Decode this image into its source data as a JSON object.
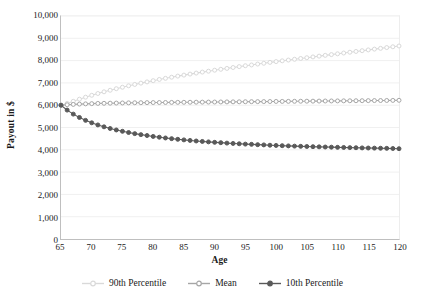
{
  "chart_data": {
    "type": "line",
    "title": "",
    "xlabel": "Age",
    "ylabel": "Payout in $",
    "xlim": [
      65,
      120
    ],
    "ylim": [
      0,
      10000
    ],
    "grid": true,
    "grid_axis": "y",
    "legend_position": "bottom",
    "xticklabels": [
      "65",
      "70",
      "75",
      "80",
      "85",
      "90",
      "95",
      "100",
      "105",
      "110",
      "115",
      "120"
    ],
    "xtickvalues": [
      65,
      70,
      75,
      80,
      85,
      90,
      95,
      100,
      105,
      110,
      115,
      120
    ],
    "yticklabels": [
      "0",
      "1,000",
      "2,000",
      "3,000",
      "4,000",
      "5,000",
      "6,000",
      "7,000",
      "8,000",
      "9,000",
      "10,000"
    ],
    "ytickvalues": [
      0,
      1000,
      2000,
      3000,
      4000,
      5000,
      6000,
      7000,
      8000,
      9000,
      10000
    ],
    "x": [
      65,
      66,
      67,
      68,
      69,
      70,
      71,
      72,
      73,
      74,
      75,
      76,
      77,
      78,
      79,
      80,
      81,
      82,
      83,
      84,
      85,
      86,
      87,
      88,
      89,
      90,
      91,
      92,
      93,
      94,
      95,
      96,
      97,
      98,
      99,
      100,
      101,
      102,
      103,
      104,
      105,
      106,
      107,
      108,
      109,
      110,
      111,
      112,
      113,
      114,
      115,
      116,
      117,
      118,
      119,
      120
    ],
    "series": [
      {
        "name": "90th Percentile",
        "color": "#d9d9d9",
        "marker": "circle",
        "values": [
          6000,
          6080,
          6175,
          6270,
          6360,
          6445,
          6525,
          6600,
          6670,
          6740,
          6805,
          6870,
          6930,
          6990,
          7045,
          7100,
          7155,
          7205,
          7255,
          7305,
          7350,
          7395,
          7440,
          7485,
          7525,
          7570,
          7610,
          7650,
          7690,
          7730,
          7770,
          7805,
          7845,
          7880,
          7920,
          7955,
          7990,
          8025,
          8060,
          8095,
          8130,
          8165,
          8200,
          8235,
          8270,
          8305,
          8340,
          8375,
          8410,
          8445,
          8480,
          8515,
          8550,
          8585,
          8620,
          8655
        ]
      },
      {
        "name": "Mean",
        "color": "#a6a6a6",
        "marker": "circle",
        "values": [
          6000,
          6020,
          6035,
          6050,
          6060,
          6070,
          6080,
          6085,
          6090,
          6095,
          6100,
          6105,
          6110,
          6112,
          6115,
          6118,
          6120,
          6122,
          6125,
          6128,
          6130,
          6132,
          6135,
          6138,
          6140,
          6142,
          6145,
          6148,
          6150,
          6152,
          6155,
          6158,
          6160,
          6162,
          6165,
          6168,
          6170,
          6172,
          6175,
          6178,
          6180,
          6182,
          6185,
          6188,
          6190,
          6192,
          6195,
          6198,
          6200,
          6202,
          6205,
          6208,
          6210,
          6212,
          6215,
          6220
        ]
      },
      {
        "name": "10th Percentile",
        "color": "#595959",
        "marker": "circle",
        "values": [
          6000,
          5780,
          5600,
          5450,
          5320,
          5210,
          5115,
          5030,
          4955,
          4890,
          4830,
          4775,
          4725,
          4680,
          4640,
          4600,
          4565,
          4530,
          4500,
          4470,
          4445,
          4420,
          4395,
          4375,
          4355,
          4335,
          4320,
          4300,
          4285,
          4270,
          4255,
          4245,
          4230,
          4220,
          4205,
          4195,
          4185,
          4175,
          4165,
          4155,
          4148,
          4140,
          4132,
          4125,
          4118,
          4110,
          4105,
          4098,
          4092,
          4085,
          4080,
          4075,
          4070,
          4065,
          4058,
          4050
        ]
      }
    ]
  },
  "legend": {
    "items": [
      {
        "label": "90th Percentile"
      },
      {
        "label": "Mean"
      },
      {
        "label": "10th Percentile"
      }
    ]
  }
}
